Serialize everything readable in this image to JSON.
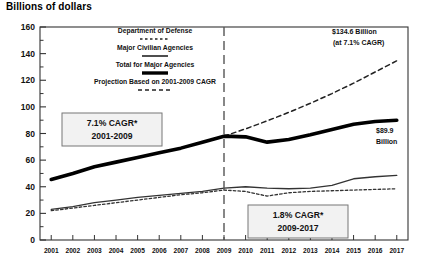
{
  "title": "Billions of dollars",
  "legend": [
    {
      "label": "Department of Defense",
      "style": "fine-dashed"
    },
    {
      "label": "Major Civilian Agencies",
      "style": "thin-solid"
    },
    {
      "label": "Total for Major Agencies",
      "style": "thick-solid"
    },
    {
      "label": "Projection Based on 2001-2009 CAGR",
      "style": "dashed"
    }
  ],
  "annotations": {
    "left_box_line1": "7.1% CAGR*",
    "left_box_line2": "2001-2009",
    "right_box_line1": "1.8% CAGR*",
    "right_box_line2": "2009-2017",
    "projection_line1": "$134.6 Billion",
    "projection_line2": "(at 7.1% CAGR)",
    "endpoint_line1": "$89.9",
    "endpoint_line2": "Billion",
    "divider_year": "2009"
  },
  "chart_data": {
    "type": "line",
    "title": "Billions of dollars",
    "xlabel": "",
    "ylabel": "Billions of dollars",
    "ylim": [
      0,
      160
    ],
    "yticks": [
      0,
      20,
      40,
      60,
      80,
      100,
      120,
      140,
      160
    ],
    "yminor_step": 10,
    "grid": false,
    "legend_position": "upper-left",
    "categories": [
      2001,
      2002,
      2003,
      2004,
      2005,
      2006,
      2007,
      2008,
      2009,
      2010,
      2011,
      2012,
      2013,
      2014,
      2015,
      2016,
      2017
    ],
    "series": [
      {
        "name": "Total for Major Agencies",
        "style": "thick-solid",
        "values": [
          45.5,
          50.0,
          55.0,
          58.5,
          62.0,
          65.5,
          69.0,
          73.5,
          78.0,
          77.5,
          73.5,
          75.5,
          79.0,
          83.0,
          87.0,
          89.0,
          89.9
        ]
      },
      {
        "name": "Major Civilian Agencies",
        "style": "thin-solid",
        "values": [
          23.0,
          25.0,
          28.0,
          30.0,
          32.0,
          33.5,
          35.0,
          36.5,
          39.0,
          40.0,
          39.0,
          38.5,
          39.0,
          41.0,
          46.0,
          47.5,
          48.5
        ]
      },
      {
        "name": "Department of Defense",
        "style": "fine-dashed",
        "values": [
          22.0,
          24.0,
          26.0,
          28.0,
          30.0,
          32.0,
          34.0,
          35.5,
          37.5,
          36.5,
          33.0,
          35.5,
          36.5,
          37.0,
          37.5,
          38.0,
          38.5
        ]
      },
      {
        "name": "Projection Based on 2001-2009 CAGR",
        "style": "dashed",
        "values": [
          null,
          null,
          null,
          null,
          null,
          null,
          null,
          null,
          78.0,
          83.5,
          89.5,
          95.9,
          102.7,
          110.0,
          117.8,
          126.2,
          134.6
        ]
      }
    ]
  }
}
